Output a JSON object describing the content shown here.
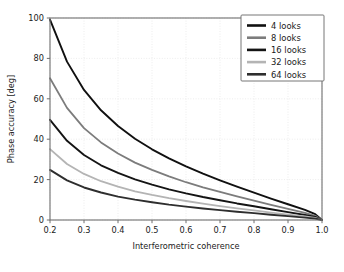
{
  "chart_data": {
    "type": "line",
    "title": "",
    "xlabel": "Interferometric coherence",
    "ylabel": "Phase accuracy [deg]",
    "xlim": [
      0.2,
      1.0
    ],
    "ylim": [
      0,
      100
    ],
    "xticks": [
      "0.2",
      "0.3",
      "0.4",
      "0.5",
      "0.6",
      "0.7",
      "0.8",
      "0.9",
      "1.0"
    ],
    "xtick_values": [
      0.2,
      0.3,
      0.4,
      0.5,
      0.6,
      0.7,
      0.8,
      0.9,
      1.0
    ],
    "yticks": [
      "0",
      "20",
      "40",
      "60",
      "80",
      "100"
    ],
    "ytick_values": [
      0,
      20,
      40,
      60,
      80,
      100
    ],
    "grid": true,
    "legend_position": "upper right",
    "x": [
      0.2,
      0.25,
      0.3,
      0.35,
      0.4,
      0.45,
      0.5,
      0.55,
      0.6,
      0.65,
      0.7,
      0.75,
      0.8,
      0.85,
      0.9,
      0.95,
      0.98,
      1.0
    ],
    "series": [
      {
        "name": "4 looks",
        "color": "#101010",
        "values": [
          99.2,
          78.4,
          64.4,
          54.3,
          46.5,
          40.2,
          35.0,
          30.5,
          26.5,
          22.9,
          19.6,
          16.5,
          13.5,
          10.6,
          7.8,
          5.0,
          2.9,
          0.0
        ]
      },
      {
        "name": "8 looks",
        "color": "#7c7c7c",
        "values": [
          70.2,
          55.5,
          45.5,
          38.4,
          32.9,
          28.4,
          24.8,
          21.6,
          18.7,
          16.2,
          13.9,
          11.7,
          9.6,
          7.5,
          5.5,
          3.5,
          2.1,
          0.0
        ]
      },
      {
        "name": "16 looks",
        "color": "#141414",
        "values": [
          49.6,
          39.2,
          32.2,
          27.1,
          23.3,
          20.1,
          17.5,
          15.2,
          13.2,
          11.4,
          9.8,
          8.2,
          6.8,
          5.3,
          3.9,
          2.5,
          1.5,
          0.0
        ]
      },
      {
        "name": "32 looks",
        "color": "#b4b4b4",
        "values": [
          35.1,
          27.7,
          22.8,
          19.2,
          16.5,
          14.2,
          12.4,
          10.8,
          9.4,
          8.1,
          6.9,
          5.8,
          4.8,
          3.7,
          2.7,
          1.8,
          1.0,
          0.0
        ]
      },
      {
        "name": "64 looks",
        "color": "#2e2e2e",
        "values": [
          24.8,
          19.6,
          16.1,
          13.6,
          11.6,
          10.1,
          8.8,
          7.6,
          6.6,
          5.7,
          4.9,
          4.1,
          3.4,
          2.6,
          1.9,
          1.2,
          0.7,
          0.0
        ]
      }
    ]
  },
  "legend": {
    "entries": [
      {
        "label": "4 looks"
      },
      {
        "label": "8 looks"
      },
      {
        "label": "16 looks"
      },
      {
        "label": "32 looks"
      },
      {
        "label": "64 looks"
      }
    ]
  },
  "axes": {
    "x_title": "Interferometric coherence",
    "y_title": "Phase accuracy [deg]",
    "x_tick_labels": [
      "0.2",
      "0.3",
      "0.4",
      "0.5",
      "0.6",
      "0.7",
      "0.8",
      "0.9",
      "1.0"
    ],
    "y_tick_labels": [
      "0",
      "20",
      "40",
      "60",
      "80",
      "100"
    ]
  },
  "colors": {
    "background": "#ffffff",
    "grid": "#e9e9e9",
    "spine": "#6f6f6f",
    "text": "#1a1a1a"
  }
}
